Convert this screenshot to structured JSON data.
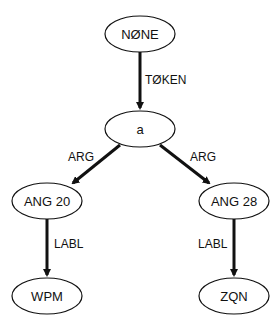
{
  "colors": {
    "stroke": "#111111",
    "background": "#ffffff"
  },
  "nodes": {
    "none": {
      "label": "NØNE"
    },
    "a": {
      "label": "a"
    },
    "ang20": {
      "label": "ANG 20"
    },
    "ang28": {
      "label": "ANG 28"
    },
    "wpm": {
      "label": "WPM"
    },
    "zqn": {
      "label": "ZQN"
    }
  },
  "edges": {
    "token": {
      "label": "TØKEN",
      "from": "NØNE",
      "to": "a"
    },
    "arg_left": {
      "label": "ARG",
      "from": "a",
      "to": "ANG 20"
    },
    "arg_right": {
      "label": "ARG",
      "from": "a",
      "to": "ANG 28"
    },
    "labl_left": {
      "label": "LABL",
      "from": "ANG 20",
      "to": "WPM"
    },
    "labl_right": {
      "label": "LABL",
      "from": "ANG 28",
      "to": "ZQN"
    }
  }
}
